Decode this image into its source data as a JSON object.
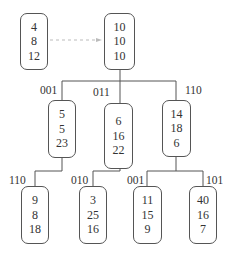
{
  "diagram": {
    "type": "kd-tree / octree-like hierarchical node diagram",
    "detached_node": {
      "id": "n0",
      "values": [
        "4",
        "8",
        "12"
      ]
    },
    "dashed_arrow": {
      "from": "n0",
      "to": "root",
      "style": "dashed"
    },
    "root": {
      "id": "root",
      "values": [
        "10",
        "10",
        "10"
      ]
    },
    "level1": [
      {
        "id": "a",
        "edge_label": "001",
        "values": [
          "5",
          "5",
          "23"
        ]
      },
      {
        "id": "b",
        "edge_label": "011",
        "values": [
          "6",
          "16",
          "22"
        ]
      },
      {
        "id": "c",
        "edge_label": "110",
        "values": [
          "14",
          "18",
          "6"
        ]
      }
    ],
    "level2": [
      {
        "id": "a1",
        "parent": "a",
        "edge_label": "110",
        "values": [
          "9",
          "8",
          "18"
        ]
      },
      {
        "id": "b1",
        "parent": "b",
        "edge_label": "010",
        "values": [
          "3",
          "25",
          "16"
        ]
      },
      {
        "id": "c1",
        "parent": "c",
        "edge_label": "001",
        "values": [
          "11",
          "15",
          "9"
        ]
      },
      {
        "id": "c2",
        "parent": "c",
        "edge_label": "101",
        "values": [
          "40",
          "16",
          "7"
        ]
      }
    ],
    "colors": {
      "line": "#555555",
      "dashed": "#bbbbbb",
      "text": "#333333"
    }
  }
}
